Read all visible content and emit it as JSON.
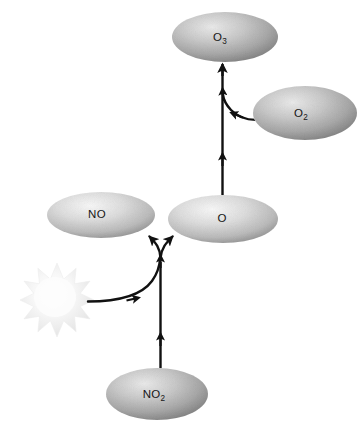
{
  "diagram": {
    "background_color": "#ffffff",
    "species_color": "#c9c9c9",
    "arrow_color": "#111111",
    "sun_color": "#f2f2f2",
    "nodes": [
      {
        "id": "o3",
        "name": "ozone",
        "formula": "O",
        "subscript": "3",
        "shape": "ellipse",
        "cx": 225,
        "cy": 37,
        "rx": 53,
        "ry": 25
      },
      {
        "id": "o2",
        "name": "molecular-oxygen",
        "formula": "O",
        "subscript": "2",
        "shape": "ellipse",
        "cx": 305,
        "cy": 113,
        "rx": 52,
        "ry": 27
      },
      {
        "id": "no",
        "name": "nitric-oxide",
        "formula": "NO",
        "subscript": "",
        "shape": "ellipse",
        "cx": 101,
        "cy": 215,
        "rx": 54,
        "ry": 23
      },
      {
        "id": "o",
        "name": "atomic-oxygen",
        "formula": "O",
        "subscript": "",
        "shape": "ellipse",
        "cx": 223,
        "cy": 219,
        "rx": 55,
        "ry": 24
      },
      {
        "id": "no2",
        "name": "nitrogen-dioxide",
        "formula": "NO",
        "subscript": "2",
        "shape": "ellipse",
        "cx": 157,
        "cy": 394,
        "rx": 51,
        "ry": 26
      }
    ],
    "sun": {
      "id": "sunlight",
      "name": "sunlight-burst",
      "cx": 57,
      "cy": 300,
      "outer_radius": 37,
      "inner_radius": 22,
      "points": 10
    },
    "arrows": [
      {
        "id": "no2-to-fork",
        "name": "arrow-no2-to-split",
        "from": "no2",
        "to": "split-point",
        "kind": "straight-vertical"
      },
      {
        "id": "sun-to-no2-path",
        "name": "arrow-sunlight-to-reaction",
        "from": "sunlight",
        "to": "split-point",
        "kind": "curved"
      },
      {
        "id": "fork-to-no",
        "name": "arrow-split-to-no",
        "from": "split-point",
        "to": "no",
        "kind": "fork-branch"
      },
      {
        "id": "fork-to-o",
        "name": "arrow-split-to-o",
        "from": "split-point",
        "to": "o",
        "kind": "fork-branch"
      },
      {
        "id": "o-to-o3",
        "name": "arrow-o-to-o3",
        "from": "o",
        "to": "o3",
        "kind": "straight-vertical"
      },
      {
        "id": "o2-to-o3-path",
        "name": "arrow-o2-to-reaction",
        "from": "o2",
        "to": "o-to-o3",
        "kind": "curved"
      }
    ]
  }
}
